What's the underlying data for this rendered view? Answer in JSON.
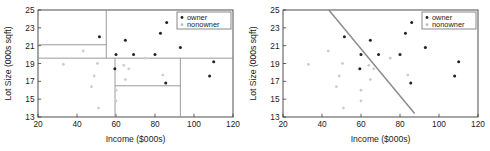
{
  "figure": {
    "panels": [
      {
        "id": "left",
        "name": "classification-tree-partition-plot"
      },
      {
        "id": "right",
        "name": "linear-discriminant-boundary-plot"
      }
    ]
  },
  "chart_data": [
    {
      "type": "scatter",
      "title": "",
      "xlabel": "Income ($000s)",
      "ylabel": "Lot Size (000s sqft)",
      "xlim": [
        20,
        120
      ],
      "ylim": [
        13,
        25
      ],
      "xticks": [
        20,
        40,
        60,
        80,
        100,
        120
      ],
      "yticks": [
        13,
        15,
        17,
        19,
        21,
        23,
        25
      ],
      "grid": false,
      "legend": {
        "position": "top-right",
        "entries": [
          {
            "label": "owner",
            "color": "#222222"
          },
          {
            "label": "nonowner",
            "color": "#bdbdbd"
          }
        ]
      },
      "series": [
        {
          "name": "owner",
          "color": "#222222",
          "points": [
            {
              "x": 51.5,
              "y": 22.0
            },
            {
              "x": 60.0,
              "y": 20.0
            },
            {
              "x": 64.8,
              "y": 21.6
            },
            {
              "x": 69.0,
              "y": 20.0
            },
            {
              "x": 80.0,
              "y": 20.0
            },
            {
              "x": 82.8,
              "y": 22.4
            },
            {
              "x": 86.0,
              "y": 23.6
            },
            {
              "x": 93.0,
              "y": 20.8
            },
            {
              "x": 59.4,
              "y": 18.4
            },
            {
              "x": 85.5,
              "y": 16.8
            },
            {
              "x": 108.0,
              "y": 17.6
            },
            {
              "x": 110.1,
              "y": 19.2
            }
          ]
        },
        {
          "name": "nonowner",
          "color": "#cccccc",
          "points": [
            {
              "x": 33.0,
              "y": 18.9
            },
            {
              "x": 43.2,
              "y": 20.4
            },
            {
              "x": 47.4,
              "y": 16.4
            },
            {
              "x": 48.8,
              "y": 17.6
            },
            {
              "x": 51.0,
              "y": 14.0
            },
            {
              "x": 60.0,
              "y": 16.0
            },
            {
              "x": 60.0,
              "y": 14.8
            },
            {
              "x": 64.8,
              "y": 17.2
            },
            {
              "x": 75.0,
              "y": 19.6
            },
            {
              "x": 84.0,
              "y": 17.7
            },
            {
              "x": 50.5,
              "y": 19.0
            },
            {
              "x": 66.5,
              "y": 18.4
            },
            {
              "x": 64.0,
              "y": 18.8
            }
          ]
        }
      ],
      "partitions": {
        "description": "recursive partitioning rectangles",
        "vertical_splits": [
          {
            "x": 55.0,
            "y_from": 19.6,
            "y_to": 25.0
          },
          {
            "x": 59.5,
            "y_from": 13.0,
            "y_to": 19.6
          },
          {
            "x": 93.0,
            "y_from": 13.0,
            "y_to": 19.6
          }
        ],
        "horizontal_splits": [
          {
            "y": 21.1,
            "x_from": 20.0,
            "x_to": 55.0
          },
          {
            "y": 19.6,
            "x_from": 20.0,
            "x_to": 120.0
          },
          {
            "y": 16.5,
            "x_from": 59.5,
            "x_to": 93.0
          }
        ]
      }
    },
    {
      "type": "scatter",
      "title": "",
      "xlabel": "Income ($000s)",
      "ylabel": "Lot Size (000s sqft)",
      "xlim": [
        20,
        120
      ],
      "ylim": [
        13,
        25
      ],
      "xticks": [
        20,
        40,
        60,
        80,
        100,
        120
      ],
      "yticks": [
        13,
        15,
        17,
        19,
        21,
        23,
        25
      ],
      "grid": false,
      "legend": {
        "position": "top-right",
        "entries": [
          {
            "label": "owner",
            "color": "#222222"
          },
          {
            "label": "nonowner",
            "color": "#bdbdbd"
          }
        ]
      },
      "series": [
        {
          "name": "owner",
          "color": "#222222",
          "points": [
            {
              "x": 51.5,
              "y": 22.0
            },
            {
              "x": 60.0,
              "y": 20.0
            },
            {
              "x": 64.8,
              "y": 21.6
            },
            {
              "x": 69.0,
              "y": 20.0
            },
            {
              "x": 80.0,
              "y": 20.0
            },
            {
              "x": 82.8,
              "y": 22.4
            },
            {
              "x": 86.0,
              "y": 23.6
            },
            {
              "x": 93.0,
              "y": 20.8
            },
            {
              "x": 59.4,
              "y": 18.4
            },
            {
              "x": 85.5,
              "y": 16.8
            },
            {
              "x": 108.0,
              "y": 17.6
            },
            {
              "x": 110.1,
              "y": 19.2
            }
          ]
        },
        {
          "name": "nonowner",
          "color": "#cccccc",
          "points": [
            {
              "x": 33.0,
              "y": 18.9
            },
            {
              "x": 43.2,
              "y": 20.4
            },
            {
              "x": 47.4,
              "y": 16.4
            },
            {
              "x": 48.8,
              "y": 17.6
            },
            {
              "x": 51.0,
              "y": 14.0
            },
            {
              "x": 60.0,
              "y": 16.0
            },
            {
              "x": 60.0,
              "y": 14.8
            },
            {
              "x": 64.8,
              "y": 17.2
            },
            {
              "x": 75.0,
              "y": 19.6
            },
            {
              "x": 84.0,
              "y": 17.7
            },
            {
              "x": 50.5,
              "y": 19.0
            },
            {
              "x": 66.5,
              "y": 18.4
            },
            {
              "x": 64.0,
              "y": 18.8
            }
          ]
        }
      ],
      "boundary_line": {
        "name": "discriminant-line",
        "color": "#8c8c8c",
        "x1": 43.5,
        "y1": 25.0,
        "x2": 87.5,
        "y2": 13.4
      }
    }
  ]
}
